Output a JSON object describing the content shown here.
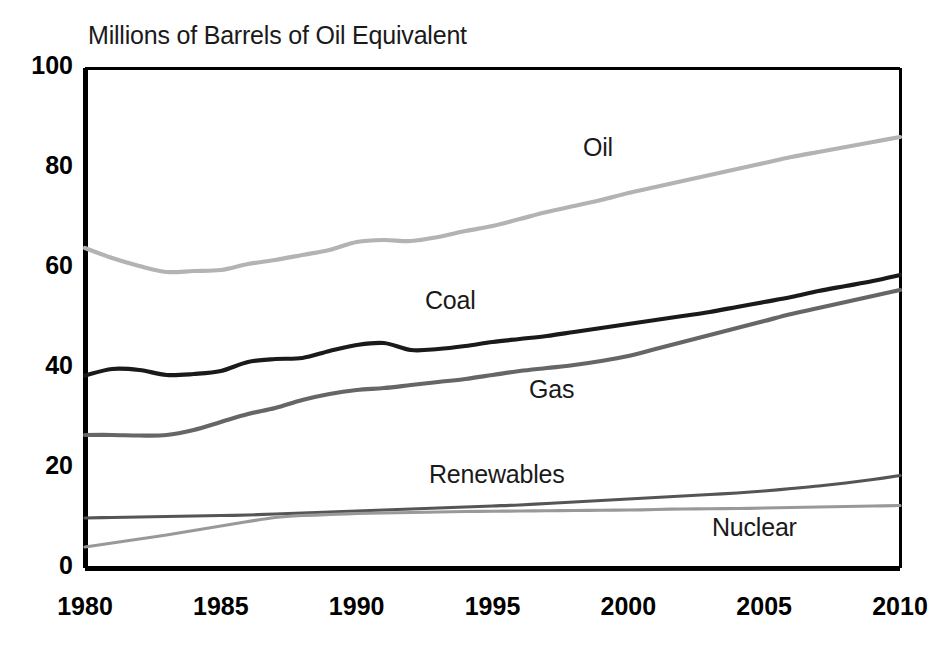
{
  "chart_data": {
    "type": "line",
    "title": "Millions of Barrels of Oil Equivalent",
    "xlabel": "",
    "ylabel": "",
    "xlim": [
      1980,
      2010
    ],
    "ylim": [
      0,
      100
    ],
    "grid": false,
    "legend_position": "inline-labels",
    "x_ticks": [
      "1980",
      "1985",
      "1990",
      "1995",
      "2000",
      "2005",
      "2010"
    ],
    "y_ticks": [
      "0",
      "20",
      "40",
      "60",
      "80",
      "100"
    ],
    "x": [
      1980,
      1981,
      1982,
      1983,
      1984,
      1985,
      1986,
      1987,
      1988,
      1989,
      1990,
      1991,
      1992,
      1993,
      1994,
      1995,
      1996,
      1997,
      1998,
      1999,
      2000,
      2001,
      2002,
      2003,
      2004,
      2005,
      2006,
      2007,
      2008,
      2009,
      2010
    ],
    "series": [
      {
        "name": "Oil",
        "color": "#b3b3b3",
        "label_x": 583,
        "label_y": 133,
        "values": [
          64.0,
          62.0,
          60.4,
          59.2,
          59.4,
          59.6,
          60.8,
          61.6,
          62.6,
          63.6,
          65.2,
          65.6,
          65.4,
          66.2,
          67.4,
          68.4,
          69.8,
          71.2,
          72.4,
          73.6,
          75.0,
          76.2,
          77.4,
          78.6,
          79.8,
          81.0,
          82.2,
          83.2,
          84.2,
          85.2,
          86.2
        ]
      },
      {
        "name": "Coal",
        "color": "#1a1a1a",
        "label_x": 425,
        "label_y": 286,
        "values": [
          38.5,
          39.8,
          39.6,
          38.6,
          38.8,
          39.4,
          41.2,
          41.8,
          42.0,
          43.4,
          44.6,
          45.0,
          43.6,
          43.8,
          44.4,
          45.2,
          45.8,
          46.4,
          47.2,
          48.0,
          48.8,
          49.6,
          50.4,
          51.2,
          52.2,
          53.2,
          54.2,
          55.4,
          56.4,
          57.4,
          58.6
        ]
      },
      {
        "name": "Gas",
        "color": "#666666",
        "label_x": 529,
        "label_y": 375,
        "values": [
          26.6,
          26.6,
          26.5,
          26.6,
          27.6,
          29.2,
          30.8,
          32.0,
          33.6,
          34.8,
          35.6,
          36.0,
          36.6,
          37.2,
          37.8,
          38.6,
          39.4,
          40.0,
          40.6,
          41.4,
          42.4,
          43.8,
          45.2,
          46.6,
          48.0,
          49.4,
          50.8,
          52.0,
          53.2,
          54.4,
          55.6
        ]
      },
      {
        "name": "Renewables",
        "color": "#555555",
        "label_x": 429,
        "label_y": 460,
        "values": [
          10.0,
          10.1,
          10.2,
          10.3,
          10.4,
          10.5,
          10.6,
          10.8,
          11.0,
          11.2,
          11.4,
          11.6,
          11.8,
          12.0,
          12.2,
          12.4,
          12.6,
          12.9,
          13.2,
          13.5,
          13.8,
          14.1,
          14.4,
          14.7,
          15.0,
          15.4,
          15.9,
          16.4,
          17.0,
          17.7,
          18.5
        ]
      },
      {
        "name": "Nuclear",
        "color": "#999999",
        "label_x": 712,
        "label_y": 513,
        "values": [
          4.2,
          5.0,
          5.8,
          6.6,
          7.5,
          8.4,
          9.3,
          10.1,
          10.5,
          10.7,
          10.9,
          11.0,
          11.1,
          11.2,
          11.3,
          11.35,
          11.4,
          11.45,
          11.5,
          11.55,
          11.6,
          11.7,
          11.8,
          11.85,
          11.9,
          12.0,
          12.1,
          12.2,
          12.3,
          12.4,
          12.5
        ]
      }
    ]
  },
  "axes": {
    "frame_color": "#000000",
    "frame_width": 4
  }
}
